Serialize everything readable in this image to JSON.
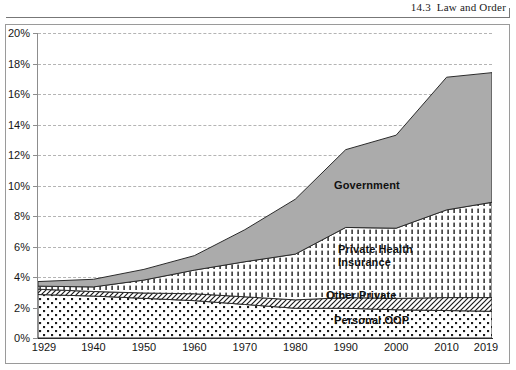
{
  "running_head": {
    "text": "14.3  Law and Order"
  },
  "chart_data": {
    "type": "area",
    "stacked": true,
    "title": "",
    "subtitle": "",
    "xlabel": "",
    "ylabel": "",
    "grid": true,
    "legend_position": "inline-labels",
    "xlim": [
      1929,
      2019
    ],
    "ylim": [
      0,
      20
    ],
    "y_tick_labels": [
      "0%",
      "2%",
      "4%",
      "6%",
      "8%",
      "10%",
      "12%",
      "14%",
      "16%",
      "18%",
      "20%"
    ],
    "y_tick_values": [
      0,
      2,
      4,
      6,
      8,
      10,
      12,
      14,
      16,
      18,
      20
    ],
    "x_tick_labels": [
      "1929",
      "1940",
      "1950",
      "1960",
      "1970",
      "1980",
      "1990",
      "2000",
      "2010",
      "2019"
    ],
    "x_tick_values": [
      1929,
      1940,
      1950,
      1960,
      1970,
      1980,
      1990,
      2000,
      2010,
      2019
    ],
    "x": [
      1929,
      1940,
      1950,
      1960,
      1970,
      1980,
      1990,
      2000,
      2010,
      2019
    ],
    "series": [
      {
        "name": "Personal OOP",
        "label": "Personal OOP",
        "pattern": "dot-grid",
        "fill": "#ffffff",
        "values": [
          2.85,
          2.75,
          2.6,
          2.45,
          2.2,
          1.95,
          1.95,
          1.85,
          1.8,
          1.75
        ]
      },
      {
        "name": "Other Private",
        "label": "Other Private",
        "pattern": "diagonal-hatch",
        "fill": "#ffffff",
        "values": [
          0.35,
          0.3,
          0.35,
          0.45,
          0.5,
          0.55,
          0.7,
          0.75,
          0.85,
          0.9
        ]
      },
      {
        "name": "Private Health Insurance",
        "label": "Private Health\nInsurance",
        "pattern": "vertical-dash-hatch",
        "fill": "#ffffff",
        "values": [
          0.2,
          0.3,
          0.85,
          1.55,
          2.3,
          3.0,
          4.6,
          4.6,
          5.75,
          6.25
        ]
      },
      {
        "name": "Government",
        "label": "Government",
        "pattern": "solid",
        "fill": "#ababab",
        "values": [
          0.3,
          0.5,
          0.7,
          0.95,
          2.1,
          3.6,
          5.1,
          6.1,
          8.7,
          8.5
        ]
      }
    ],
    "totals": [
      3.7,
      3.85,
      4.5,
      5.4,
      7.1,
      9.1,
      12.35,
      13.3,
      17.1,
      17.4
    ]
  },
  "axis": {
    "y_unit": "%",
    "x_unit": "year"
  }
}
